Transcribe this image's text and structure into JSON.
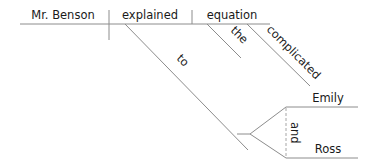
{
  "diagram": {
    "type": "sentence-diagram",
    "subject": "Mr. Benson",
    "verb": "explained",
    "direct_object": "equation",
    "object_modifiers": [
      "the",
      "complicated"
    ],
    "preposition": "to",
    "prepositional_objects": [
      "Emily",
      "Ross"
    ],
    "conjunction": "and",
    "line_color": "#8c8c8c",
    "text_color": "#1a1a1a"
  }
}
